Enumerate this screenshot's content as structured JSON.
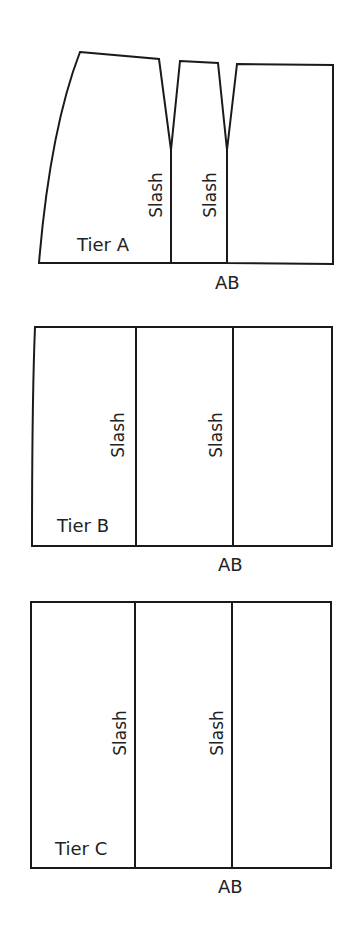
{
  "diagram": {
    "type": "pattern-slash-and-spread",
    "colors": {
      "line": "#1a1a1a",
      "text": "#222222",
      "background": "#ffffff"
    },
    "tiers": [
      {
        "id": "A",
        "label": "Tier A",
        "slash_labels": [
          "Slash",
          "Slash"
        ],
        "bottom_label": "AB",
        "pieces": 3,
        "shape": "flared-with-darts"
      },
      {
        "id": "B",
        "label": "Tier B",
        "slash_labels": [
          "Slash",
          "Slash"
        ],
        "bottom_label": "AB",
        "pieces": 3,
        "shape": "rectangle"
      },
      {
        "id": "C",
        "label": "Tier C",
        "slash_labels": [
          "Slash",
          "Slash"
        ],
        "bottom_label": "AB",
        "pieces": 3,
        "shape": "rectangle"
      }
    ]
  }
}
